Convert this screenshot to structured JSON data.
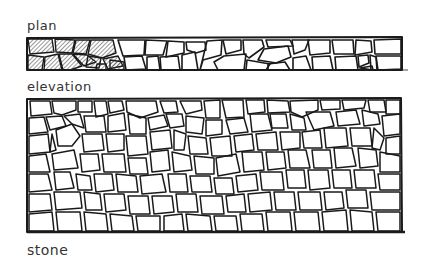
{
  "labels": {
    "plan": "plan",
    "elevation": "elevation",
    "material": "stone"
  },
  "colors": {
    "ink": "#1a1a1a",
    "background": "#ffffff",
    "hatch": "#444444"
  }
}
